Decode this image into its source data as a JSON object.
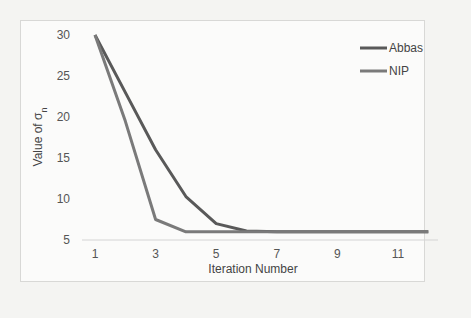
{
  "chart_data": {
    "type": "line",
    "title": "",
    "xlabel": "Iteration Number",
    "ylabel": "Value of σ_n",
    "ylabel_display": "Value of σ",
    "ylabel_subscript": "n",
    "x": [
      1,
      2,
      3,
      4,
      5,
      6,
      7,
      8,
      9,
      10,
      11,
      12
    ],
    "x_tick_labels": [
      "1",
      "3",
      "5",
      "7",
      "9",
      "11"
    ],
    "y_tick_labels": [
      "5",
      "10",
      "15",
      "20",
      "25",
      "30"
    ],
    "ylim": [
      5,
      30
    ],
    "xlim": [
      1,
      12
    ],
    "grid": false,
    "legend_position": "upper right",
    "series": [
      {
        "name": "Abbas",
        "color": "#595959",
        "values": [
          30,
          23,
          16,
          10.3,
          7,
          6.1,
          6,
          6,
          6,
          6,
          6,
          6
        ]
      },
      {
        "name": "NIP",
        "color": "#7a7a7a",
        "values": [
          30,
          19.5,
          7.5,
          6,
          6,
          6,
          6,
          6,
          6,
          6,
          6,
          6
        ]
      }
    ]
  }
}
